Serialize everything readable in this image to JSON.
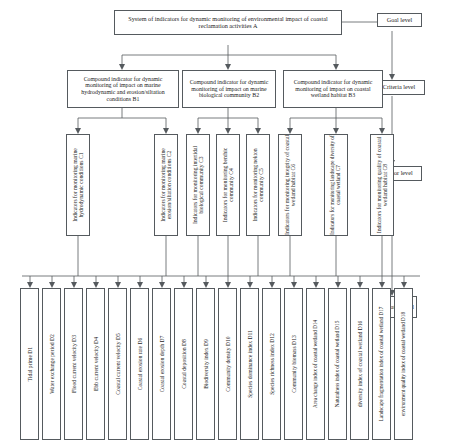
{
  "diagram": {
    "title": "System of indicators for dynamic monitoring of environmental impact of coastal reclamation activities A",
    "levels": {
      "goal": "Goal level",
      "criteria": "Criteria level",
      "factor": "Factor level",
      "indicator": "Indicator level"
    },
    "goal": {
      "id": "A",
      "label": "System of indicators for dynamic monitoring of environmental impact of coastal reclamation activities A"
    },
    "criteria": [
      {
        "id": "B1",
        "label": "Compound indicator for dynamic monitoring of impact on marine hydrodynamic and erosion/siltation conditions B1"
      },
      {
        "id": "B2",
        "label": "Compound indicator for dynamic monitoring of impact on marine biological community B2"
      },
      {
        "id": "B3",
        "label": "Compound indicator for dynamic monitoring of impact on coastal wetland habitat B3"
      }
    ],
    "factors": [
      {
        "id": "C1",
        "label": "Indicators for monitoring marine hydrodynamic conditions C1"
      },
      {
        "id": "C2",
        "label": "Indicators for monitoring marine erosion/siltation conditions C2"
      },
      {
        "id": "C3",
        "label": "Indicators for monitoring intertidal biological community C3"
      },
      {
        "id": "C4",
        "label": "Indicators for monitoring benthic community C4"
      },
      {
        "id": "C5",
        "label": "Indicators for monitoring nekton community C5"
      },
      {
        "id": "C6",
        "label": "Indicators for monitoring integrity of coastal wetland habitat C6"
      },
      {
        "id": "C7",
        "label": "Indicators for monitoring landscape diversity of coastal wetland C7"
      },
      {
        "id": "C8",
        "label": "Indicators for monitoring quality of coastal wetland habitat C8"
      }
    ],
    "indicators": [
      {
        "id": "D1",
        "label": "Tidal prime D1"
      },
      {
        "id": "D2",
        "label": "Water exchange period D2"
      },
      {
        "id": "D3",
        "label": "Flood current velocity D3"
      },
      {
        "id": "D4",
        "label": "Ebb current velocity D4"
      },
      {
        "id": "D5",
        "label": "Coastal current velocity D5"
      },
      {
        "id": "D6",
        "label": "Coastal erosion rate D6"
      },
      {
        "id": "D7",
        "label": "Coastal erosion depth D7"
      },
      {
        "id": "D8",
        "label": "Coastal deposition D8"
      },
      {
        "id": "D9",
        "label": "Biodiversity index D9"
      },
      {
        "id": "D10",
        "label": "Community density D10"
      },
      {
        "id": "D11",
        "label": "Species dominance index D11"
      },
      {
        "id": "D12",
        "label": "Species richness index D12"
      },
      {
        "id": "D13",
        "label": "Community biomass D13"
      },
      {
        "id": "D14",
        "label": "Area change index of coastal wetland D14"
      },
      {
        "id": "D15",
        "label": "Naturalness index of coastal wetland D15"
      },
      {
        "id": "D16",
        "label": "diversity index of coastal wetland D16"
      },
      {
        "id": "D17",
        "label": "Landscape fragmentation index of coastal wetland D17"
      },
      {
        "id": "D18",
        "label": "environment quality index of coastal wetland D18"
      }
    ]
  }
}
